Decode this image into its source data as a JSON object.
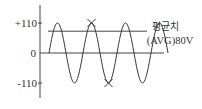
{
  "chart_data": {
    "type": "line",
    "title": "",
    "xlabel": "",
    "ylabel": "",
    "ylim": [
      -110,
      110
    ],
    "yticks": [
      {
        "value": 110,
        "label": "+110"
      },
      {
        "value": 0,
        "label": "0"
      },
      {
        "value": -110,
        "label": "-110"
      }
    ],
    "series": [
      {
        "name": "AC voltage (sine)",
        "amplitude": 110,
        "cycles": 3.5,
        "start_phase": "rising from 0"
      }
    ],
    "average_line": {
      "value": 80,
      "label_line1": "평균치",
      "label_line2": "(AVG)80V"
    },
    "markers": [
      {
        "type": "x",
        "at": "second positive peak",
        "value": 110
      },
      {
        "type": "x",
        "at": "second negative peak",
        "value": -110
      }
    ],
    "grid": false
  }
}
